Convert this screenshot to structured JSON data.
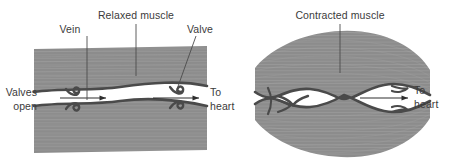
{
  "figure": {
    "title_none": "",
    "colors": {
      "muscle_fill": "#8c8c8c",
      "muscle_striation": "#9a9a9a",
      "vein_wall": "#4a4a4a",
      "lumen_fill": "#ffffff",
      "text": "#3b3b3b",
      "leader_line": "#4c4c4c",
      "arrow": "#2e2e2e",
      "background": "#ffffff"
    }
  },
  "left_panel": {
    "name": "relaxed-muscle-panel",
    "labels": {
      "muscle": "Relaxed muscle",
      "vein": "Vein",
      "valve": "Valve",
      "valves_state_line1": "Valves",
      "valves_state_line2": "open",
      "destination_line1": "To",
      "destination_line2": "heart"
    },
    "flow_arrows": 2,
    "valves": 2,
    "valve_state": "open"
  },
  "right_panel": {
    "name": "contracted-muscle-panel",
    "labels": {
      "muscle": "Contracted muscle",
      "destination_line1": "To",
      "destination_line2": "heart"
    },
    "flow_arrows": 1,
    "valves": 2,
    "valve_state": "closed"
  }
}
